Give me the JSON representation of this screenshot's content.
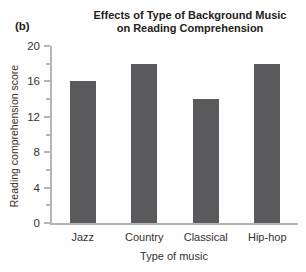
{
  "panel_label": "(b)",
  "chart_data": {
    "type": "bar",
    "title": "Effects of Type of Background Music on Reading Comprehension",
    "title_lines": [
      "Effects of Type of Background Music",
      "on Reading Comprehension"
    ],
    "xlabel": "Type of music",
    "ylabel": "Reading comprehension score",
    "categories": [
      "Jazz",
      "Country",
      "Classical",
      "Hip-hop"
    ],
    "values": [
      16,
      18,
      14,
      18
    ],
    "ylim": [
      0,
      20
    ],
    "yticks_major": [
      0,
      4,
      8,
      12,
      16,
      20
    ],
    "yticks_minor": [
      2,
      6,
      10,
      14,
      18
    ],
    "grid": false,
    "legend": "none",
    "colors": {
      "bar": "#5a5a5c",
      "axis": "#b5b5b5",
      "text": "#37332e",
      "title": "#262220"
    }
  }
}
